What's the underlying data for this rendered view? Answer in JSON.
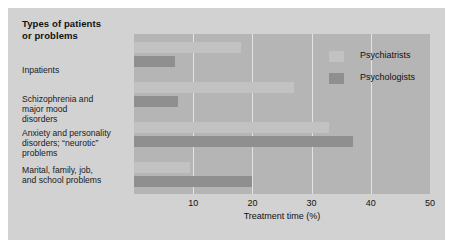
{
  "figure": {
    "category_heading": "Types of patients\nor problems",
    "background_color": "#d2d2d2",
    "plot_background_color": "#b5b5b5",
    "gridline_color": "#e2e2e2"
  },
  "legend": {
    "position": "top-right-inside",
    "entries": [
      {
        "label": "Psychiatrists",
        "color": "#c2c2c2",
        "swatch_name": "legend-swatch-psychiatrists"
      },
      {
        "label": "Psychologists",
        "color": "#8f8f8f",
        "swatch_name": "legend-swatch-psychologists"
      }
    ]
  },
  "chart_data": {
    "type": "bar",
    "orientation": "horizontal",
    "title": "",
    "subtitle": "",
    "xlabel": "Treatment time (%)",
    "ylabel": "Types of patients or problems",
    "xlim": [
      0,
      50
    ],
    "xticks": [
      10,
      20,
      30,
      40,
      50
    ],
    "xtick_labels": [
      "10",
      "20",
      "30",
      "40",
      "50"
    ],
    "grid": true,
    "grid_axis": "x",
    "categories": [
      "Inpatients",
      "Schizophrenia and major mood disorders",
      "Anxiety and personality disorders; “neurotic” problems",
      "Marital, family, job, and school problems"
    ],
    "category_label_lines": [
      [
        "Inpatients"
      ],
      [
        "Schizophrenia and",
        "major mood",
        "disorders"
      ],
      [
        "Anxiety and personality",
        "disorders; “neurotic”",
        "problems"
      ],
      [
        "Marital, family, job,",
        "and school problems"
      ]
    ],
    "series": [
      {
        "name": "Psychiatrists",
        "color": "#c2c2c2",
        "values": [
          18,
          27,
          33,
          9.5
        ]
      },
      {
        "name": "Psychologists",
        "color": "#8f8f8f",
        "values": [
          7,
          7.5,
          37,
          20
        ]
      }
    ],
    "units": "percent"
  }
}
